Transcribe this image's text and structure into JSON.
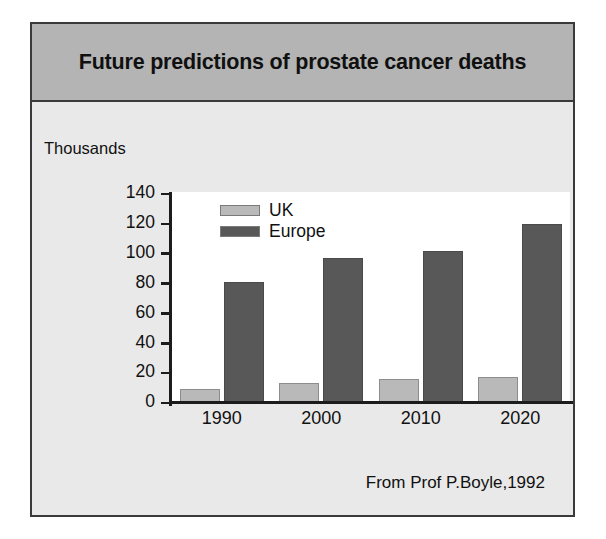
{
  "slide": {
    "title": "Future predictions of prostate cancer deaths",
    "source_note": "From Prof P.Boyle,1992"
  },
  "colors": {
    "uk_bar": "#b9b9b9",
    "europe_bar": "#585858",
    "title_banner": "#b4b4b4",
    "slide_background": "#e9e9e9",
    "plot_background": "#ffffff",
    "axis": "#1c1c1c"
  },
  "chart_data": {
    "type": "bar",
    "title": "Future predictions of prostate cancer deaths",
    "subtitle": "",
    "xlabel": "",
    "ylabel": "Thousands",
    "categories": [
      "1990",
      "2000",
      "2010",
      "2020"
    ],
    "series": [
      {
        "name": "UK",
        "values": [
          9,
          13,
          16,
          17
        ],
        "color": "#b9b9b9"
      },
      {
        "name": "Europe",
        "values": [
          80,
          96,
          101,
          119
        ],
        "color": "#585858"
      }
    ],
    "ylim": [
      0,
      140
    ],
    "yticks": [
      0,
      20,
      40,
      60,
      80,
      100,
      120,
      140
    ],
    "ytick_labels": [
      "0",
      "20",
      "40",
      "60",
      "80",
      "100",
      "120",
      "140"
    ],
    "grid": false,
    "legend_position": "top-left-inside",
    "annotations": [
      "From Prof P.Boyle,1992"
    ]
  }
}
